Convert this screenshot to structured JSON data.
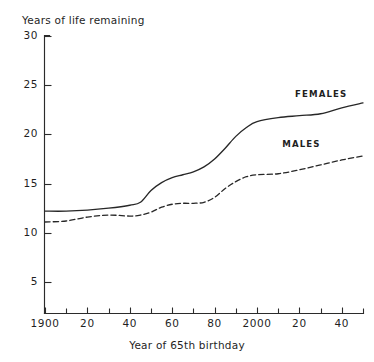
{
  "chart_data": {
    "type": "line",
    "title": "",
    "xlabel": "Year of 65th birthday",
    "ylabel": "Years of life remaining",
    "xlim": [
      1900,
      2050
    ],
    "ylim": [
      0,
      30
    ],
    "grid": false,
    "legend_position": "inline-right",
    "x_tick_labels": [
      "1900",
      "20",
      "40",
      "60",
      "80",
      "2000",
      "20",
      "40"
    ],
    "x_tick_values": [
      1900,
      1920,
      1940,
      1960,
      1980,
      2000,
      2020,
      2040
    ],
    "x_minor_tick_values": [
      1910,
      1930,
      1950,
      1970,
      1990,
      2010,
      2030,
      2050
    ],
    "y_tick_labels": [
      "30",
      "25",
      "20",
      "15",
      "10",
      "5"
    ],
    "y_tick_values": [
      30,
      25,
      20,
      15,
      10,
      5
    ],
    "x": [
      1900,
      1910,
      1920,
      1930,
      1940,
      1945,
      1950,
      1955,
      1960,
      1965,
      1970,
      1975,
      1980,
      1985,
      1990,
      1995,
      2000,
      2010,
      2020,
      2030,
      2040,
      2050
    ],
    "series": [
      {
        "name": "FEMALES",
        "style": "solid",
        "label": "FEMALES",
        "color": "#272727",
        "values": [
          12.2,
          12.2,
          12.3,
          12.5,
          12.8,
          13.1,
          14.3,
          15.1,
          15.6,
          15.9,
          16.2,
          16.7,
          17.5,
          18.6,
          19.8,
          20.7,
          21.3,
          21.7,
          21.9,
          22.1,
          22.7,
          23.2
        ]
      },
      {
        "name": "MALES",
        "style": "dashed",
        "label": "MALES",
        "color": "#272727",
        "values": [
          11.1,
          11.2,
          11.6,
          11.8,
          11.7,
          11.8,
          12.1,
          12.6,
          12.9,
          13.0,
          13.0,
          13.1,
          13.6,
          14.5,
          15.2,
          15.7,
          15.9,
          16.0,
          16.4,
          16.9,
          17.4,
          17.8
        ]
      }
    ],
    "annotations": [
      {
        "name": "females-label",
        "text": "FEMALES",
        "x": 2034,
        "y": 24.0
      },
      {
        "name": "males-label",
        "text": "MALES",
        "x": 2028,
        "y": 18.9
      }
    ]
  }
}
